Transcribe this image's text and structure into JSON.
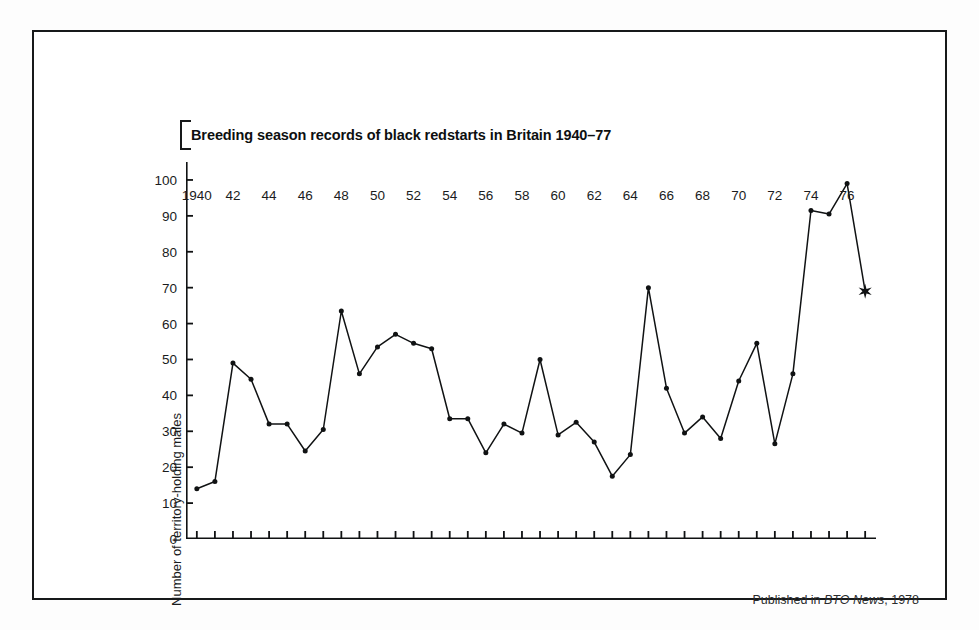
{
  "chart_data": {
    "type": "line",
    "title": "Breeding season records of black redstarts in Britain 1940–77",
    "xlabel": "",
    "ylabel": "Number of territory-holding males",
    "x": [
      1940,
      1941,
      1942,
      1943,
      1944,
      1945,
      1946,
      1947,
      1948,
      1949,
      1950,
      1951,
      1952,
      1953,
      1954,
      1955,
      1956,
      1957,
      1958,
      1959,
      1960,
      1961,
      1962,
      1963,
      1964,
      1965,
      1966,
      1967,
      1968,
      1969,
      1970,
      1971,
      1972,
      1973,
      1974,
      1975,
      1976,
      1977
    ],
    "values": [
      14,
      16,
      49,
      44.5,
      32,
      32,
      24.5,
      30.5,
      63.5,
      46,
      53.5,
      57,
      54.5,
      53,
      33.5,
      33.5,
      24,
      32,
      29.5,
      50,
      29,
      32.5,
      27,
      17.5,
      23.5,
      70,
      42,
      29.5,
      34,
      28,
      44,
      54.5,
      26.5,
      46,
      91.5,
      90.5,
      99,
      69
    ],
    "xlim": [
      1939.4,
      1977.6
    ],
    "ylim": [
      0,
      105
    ],
    "yticks": [
      0,
      10,
      20,
      30,
      40,
      50,
      60,
      70,
      80,
      90,
      100
    ],
    "ytick_labels": [
      "0",
      "10",
      "20",
      "30",
      "40",
      "50",
      "60",
      "70",
      "80",
      "90",
      "100"
    ],
    "xticks": [
      1940,
      1941,
      1942,
      1943,
      1944,
      1945,
      1946,
      1947,
      1948,
      1949,
      1950,
      1951,
      1952,
      1953,
      1954,
      1955,
      1956,
      1957,
      1958,
      1959,
      1960,
      1961,
      1962,
      1963,
      1964,
      1965,
      1966,
      1967,
      1968,
      1969,
      1970,
      1971,
      1972,
      1973,
      1974,
      1975,
      1976,
      1977
    ],
    "xtick_labels": [
      {
        "x": 1940,
        "label": "1940"
      },
      {
        "x": 1942,
        "label": "42"
      },
      {
        "x": 1944,
        "label": "44"
      },
      {
        "x": 1946,
        "label": "46"
      },
      {
        "x": 1948,
        "label": "48"
      },
      {
        "x": 1950,
        "label": "50"
      },
      {
        "x": 1952,
        "label": "52"
      },
      {
        "x": 1954,
        "label": "54"
      },
      {
        "x": 1956,
        "label": "56"
      },
      {
        "x": 1958,
        "label": "58"
      },
      {
        "x": 1960,
        "label": "60"
      },
      {
        "x": 1962,
        "label": "62"
      },
      {
        "x": 1964,
        "label": "64"
      },
      {
        "x": 1966,
        "label": "66"
      },
      {
        "x": 1968,
        "label": "68"
      },
      {
        "x": 1970,
        "label": "70"
      },
      {
        "x": 1972,
        "label": "72"
      },
      {
        "x": 1974,
        "label": "74"
      },
      {
        "x": 1976,
        "label": "76"
      }
    ],
    "special_markers": [
      {
        "x": 1977,
        "y": 69,
        "shape": "star",
        "note": "star-marker"
      }
    ],
    "grid": false,
    "legend": null,
    "line_color": "#101213",
    "marker_color": "#101213"
  },
  "figure": {
    "footer_prefix": "Published in ",
    "footer_source": "BTO News",
    "footer_suffix": ", 1978",
    "border_color": "#17191a",
    "background": "#ffffff"
  }
}
